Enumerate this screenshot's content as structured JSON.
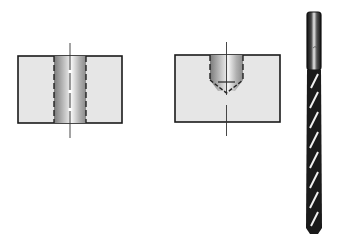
{
  "figure": {
    "panels": [
      {
        "name": "through-hole",
        "label": ""
      },
      {
        "name": "blind-hole",
        "label": ""
      },
      {
        "name": "twist-drill",
        "label": ""
      }
    ],
    "colors": {
      "block_fill": "#e8e8e8",
      "outline": "#1a1a1a",
      "hole_light": "#f5f5f5",
      "hole_dark": "#8a8a8a",
      "drill_dark": "#111111"
    }
  }
}
